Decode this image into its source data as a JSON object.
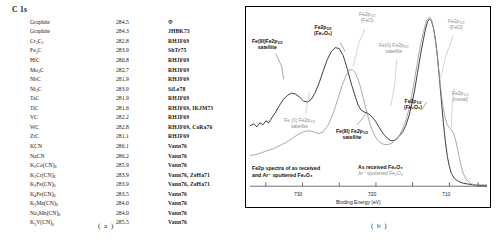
{
  "panel_a": {
    "heading": "C 1s",
    "caption": "( a )",
    "columns": [
      "Species",
      "Binding Energy (eV)",
      "Reference"
    ],
    "rows": [
      {
        "species": "Graphite",
        "value": "284.5",
        "ref": "Φ"
      },
      {
        "species": "Graphite",
        "value": "284.3",
        "ref": "JHBK73"
      },
      {
        "species": "Cr3C2",
        "value": "282.8",
        "ref": "RHJF69"
      },
      {
        "species": "Fe3C",
        "value": "283.9",
        "ref": "ShTr75"
      },
      {
        "species": "HfC",
        "value": "280.8",
        "ref": "RHJF69"
      },
      {
        "species": "Mo2C",
        "value": "282.7",
        "ref": "RHJF69"
      },
      {
        "species": "NbC",
        "value": "281.9",
        "ref": "RHJF69"
      },
      {
        "species": "Ni3C",
        "value": "283.9",
        "ref": "SiLe78"
      },
      {
        "species": "TaC",
        "value": "281.9",
        "ref": "RHJF69"
      },
      {
        "species": "TiC",
        "value": "281.6",
        "ref": "RHJF69, IKJM73"
      },
      {
        "species": "VC",
        "value": "282.2",
        "ref": "RHJF69"
      },
      {
        "species": "WC",
        "value": "282.8",
        "ref": "RHJF69, CoRa76"
      },
      {
        "species": "ZrC",
        "value": "281.1",
        "ref": "RHJF69"
      },
      {
        "species": "KCN",
        "value": "286.1",
        "ref": "Vann76"
      },
      {
        "species": "NaCN",
        "value": "286.2",
        "ref": "Vann76"
      },
      {
        "species": "K3Co(CN)6",
        "value": "285.9",
        "ref": "Vann76"
      },
      {
        "species": "K3Cr(CN)6",
        "value": "283.9",
        "ref": "Vann76, ZeHa71"
      },
      {
        "species": "K3Fe(CN)6",
        "value": "283.9",
        "ref": "Vann76, ZeHa71"
      },
      {
        "species": "K4Fe(CN)6",
        "value": "283.5",
        "ref": "Vann76"
      },
      {
        "species": "K3Mn(CN)6",
        "value": "284.0",
        "ref": "Vann76"
      },
      {
        "species": "Na3Mn(CN)6",
        "value": "284.0",
        "ref": "Vann76"
      },
      {
        "species": "K3V(CN)6",
        "value": "285.5",
        "ref": "Vann76"
      }
    ]
  },
  "panel_b": {
    "caption": "( b )",
    "box_caption_line1": "Fe2p spectra of as received",
    "box_caption_line2": "and Ar⁺ sputtered Fe₂O₃",
    "legend": [
      {
        "label": "As received Fe₂O₃",
        "style": "dark",
        "color": "#111111"
      },
      {
        "label": "Ar⁺ sputtered Fe₂O₃",
        "style": "grey",
        "color": "#8d8d8d"
      }
    ],
    "annotations": [
      {
        "id": "ann-fe3-2p32-satellite-dark",
        "line1": "Fe(III)Fe2p",
        "sub1": "3/2",
        "line2": "satellite",
        "style": "dark"
      },
      {
        "id": "ann-fe2p32-fe2o3-dark",
        "line1": "Fe2p",
        "sub1": "3/2",
        "line2": "(Fe₂O₃)",
        "style": "dark"
      },
      {
        "id": "ann-fe2p32-feo-grey",
        "line1": "Fe2p",
        "sub1": "3/2",
        "line2": "(FeO)",
        "style": "grey"
      },
      {
        "id": "ann-fe2-2p32-satellite-grey-top",
        "line1": "Fe(II) Fe2p",
        "sub1": "3/2",
        "line2": "satellite",
        "style": "grey"
      },
      {
        "id": "ann-fe2p12-feo-grey",
        "line1": "Fe2p",
        "sub1": "1/2",
        "line2": "(FeO)",
        "style": "grey"
      },
      {
        "id": "ann-fe2p12-metal-grey",
        "line1": "Fe2p",
        "sub1": "1/2",
        "line2": "(metal)",
        "style": "grey"
      },
      {
        "id": "ann-fe2p12-fe2o3-dark",
        "line1": "Fe2p",
        "sub1": "1/2",
        "line2": "(Fe₂O₃)",
        "style": "dark"
      },
      {
        "id": "ann-fe2-2p12-satellite-grey",
        "line1": "Fe (II) Fe2p",
        "sub1": "1/2",
        "line2": "satellite",
        "style": "grey"
      },
      {
        "id": "ann-fe3-2p12-satellite-dark",
        "line1": "Fe(III) Fe2p",
        "sub1": "1/2",
        "line2": "satellite",
        "style": "dark"
      }
    ]
  },
  "chart_data": {
    "type": "line",
    "xlabel": "Binding Energy (eV)",
    "ylabel": "",
    "xlim": [
      737,
      705
    ],
    "x_ticks": [
      "730",
      "720",
      "710"
    ],
    "x_tick_values": [
      730,
      720,
      710
    ],
    "x_reversed": true,
    "grid": false,
    "legend_position": "bottom-center",
    "series": [
      {
        "name": "As received Fe2O3",
        "color": "#111111",
        "peaks": [
          {
            "label": "Fe(III)Fe2p3/2 satellite",
            "binding_energy": 733.5,
            "relative_intensity": 0.3
          },
          {
            "label": "Fe2p3/2 (Fe2O3)",
            "binding_energy": 728.0,
            "relative_intensity": 0.56
          },
          {
            "label": "Fe(III) Fe2p1/2 satellite",
            "binding_energy": 719.5,
            "relative_intensity": 0.22
          },
          {
            "label": "Fe2p1/2 (Fe2O3)",
            "binding_energy": 711.0,
            "relative_intensity": 1.0
          }
        ]
      },
      {
        "name": "Ar+ sputtered Fe2O3",
        "color": "#8d8d8d",
        "peaks": [
          {
            "label": "Fe (II) Fe2p1/2 satellite",
            "binding_energy": 732.0,
            "relative_intensity": 0.16
          },
          {
            "label": "Fe2p3/2 (FeO)",
            "binding_energy": 726.5,
            "relative_intensity": 0.5
          },
          {
            "label": "Fe(II) Fe2p3/2 satellite",
            "binding_energy": 721.0,
            "relative_intensity": 0.2
          },
          {
            "label": "Fe2p1/2 (FeO)",
            "binding_energy": 710.3,
            "relative_intensity": 0.98
          },
          {
            "label": "Fe2p1/2 (metal)",
            "binding_energy": 707.8,
            "relative_intensity": 0.45
          }
        ]
      }
    ]
  }
}
